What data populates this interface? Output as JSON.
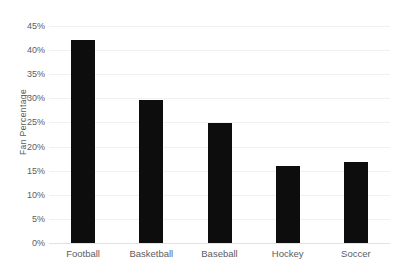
{
  "chart_data": {
    "type": "bar",
    "title": "",
    "subtitle": "",
    "xlabel": "",
    "ylabel": "Fan Percentage",
    "categories": [
      "Football",
      "Basketball",
      "Baseball",
      "Hockey",
      "Soccer"
    ],
    "values": [
      42.2,
      29.7,
      24.8,
      15.9,
      16.8
    ],
    "value_labels": [
      "42.2%",
      "29.7%",
      "24.8%",
      "15.9%",
      "16.8%"
    ],
    "series": [
      {
        "name": "Fan Percentage",
        "values": [
          42.2,
          29.7,
          24.8,
          15.9,
          16.8
        ]
      }
    ],
    "ylim": [
      0,
      45
    ],
    "ytick_values": [
      0,
      5,
      10,
      15,
      20,
      25,
      30,
      35,
      40,
      45
    ],
    "ytick_labels": [
      "0%",
      "5%",
      "10%",
      "15%",
      "20%",
      "25%",
      "30%",
      "35%",
      "40%",
      "45%"
    ],
    "grid": true,
    "grid_axis": "y",
    "legend": false,
    "legend_position": "none",
    "bar_color": "#0d0d0d",
    "gridline_color": "#f1f1f1",
    "axis_color": "#e2e2e2",
    "text_color": "#5d5d5d",
    "background_color": "#ffffff",
    "annotations": []
  }
}
